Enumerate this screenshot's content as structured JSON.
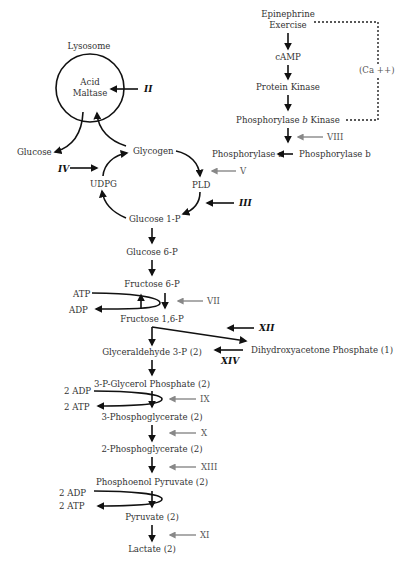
{
  "lysosome": {
    "label": "Lysosome",
    "enzyme_line1": "Acid",
    "enzyme_line2": "Maltase",
    "defect": "II"
  },
  "signaling": {
    "epinephrine": "Epinephrine",
    "exercise": "Exercise",
    "camp": "cAMP",
    "protein_kinase": "Protein Kinase",
    "phos_b_kinase_pre": "Phosphorylase ",
    "phos_b_kinase_b": "b",
    "phos_b_kinase_post": " Kinase",
    "calcium": "(Ca ++)",
    "phos_a": "Phosphorylase a",
    "phos_b": "Phosphorylase b",
    "defect_VIII": "VIII"
  },
  "glycogen_cycle": {
    "glucose": "Glucose",
    "glycogen": "Glycogen",
    "udpg": "UDPG",
    "pld": "PLD",
    "glucose_1p": "Glucose 1-P",
    "defect_IV": "IV",
    "defect_V": "V",
    "defect_III": "III"
  },
  "glycolysis": {
    "glucose_6p": "Glucose 6-P",
    "fructose_6p": "Fructose 6-P",
    "atp1": "ATP",
    "adp1": "ADP",
    "defect_VII": "VII",
    "fructose_16p": "Fructose 1,6-P",
    "defect_XII": "XII",
    "dhap": "Dihydroxyacetone Phosphate (1)",
    "defect_XIV": "XIV",
    "g3p": "Glyceraldehyde 3-P (2)",
    "p_glycerol": "3-P-Glycerol Phosphate (2)",
    "adp2": "2 ADP",
    "atp2": "2 ATP",
    "defect_IX": "IX",
    "pg3": "3-Phosphoglycerate (2)",
    "defect_X": "X",
    "pg2": "2-Phosphoglycerate (2)",
    "defect_XIII": "XIII",
    "pep": "Phosphoenol Pyruvate (2)",
    "adp3": "2 ADP",
    "atp3": "2 ATP",
    "pyruvate": "Pyruvate (2)",
    "defect_XI": "XI",
    "lactate": "Lactate (2)"
  },
  "colors": {
    "black_arrow": "#111111",
    "gray_arrow": "#888888",
    "text": "#333333"
  }
}
